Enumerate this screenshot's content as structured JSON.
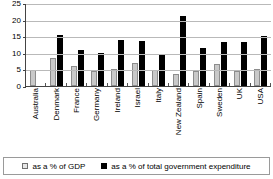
{
  "chart_data": {
    "type": "bar",
    "title": "",
    "subtitle": "",
    "xlabel": "",
    "ylabel": "",
    "ylim": [
      0,
      25
    ],
    "ytick_labels": [
      "0",
      "5",
      "10",
      "15",
      "20",
      "25"
    ],
    "yticks": [
      0,
      5,
      10,
      15,
      20,
      25
    ],
    "grid": true,
    "legend_position": "bottom",
    "categories": [
      "Australia",
      "Denmark",
      "France",
      "Germany",
      "Ireland",
      "Israel",
      "Italy",
      "New Zealand",
      "Spain",
      "Sweden",
      "UK",
      "USA"
    ],
    "series": [
      {
        "name": "as a % of GDP",
        "color": "#c9c9c9",
        "values": [
          4.7,
          8.5,
          5.9,
          4.6,
          5.0,
          6.8,
          4.7,
          3.5,
          4.4,
          6.6,
          4.6,
          5.2
        ]
      },
      {
        "name": "as a % of total government expenditure",
        "color": "#000000",
        "values": [
          0,
          15.3,
          10.9,
          10.0,
          14.0,
          13.7,
          9.6,
          21.0,
          11.3,
          13.3,
          13.3,
          15.2
        ]
      }
    ]
  },
  "legend": {
    "items": [
      {
        "label": "as a % of GDP",
        "swatch": "gdp"
      },
      {
        "label": "as a % of total government expenditure",
        "swatch": "exp"
      }
    ]
  },
  "colors": {
    "gdp_fill": "#c9c9c9",
    "gdp_stroke": "#8c8c8c",
    "expenditure_fill": "#000000",
    "gridline": "#b9b9b9",
    "axis": "#444444"
  }
}
